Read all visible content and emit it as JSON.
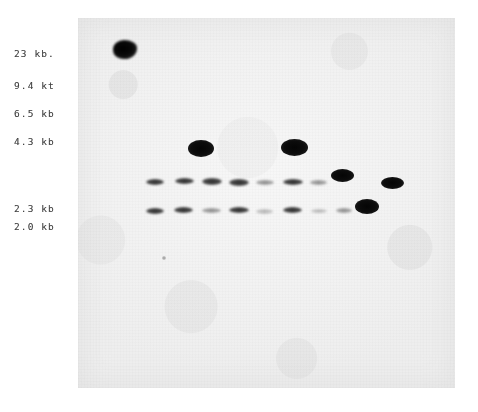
{
  "figure": {
    "type": "southern-blot-autoradiograph",
    "background_color": "#ffffff",
    "membrane_color": "#f2f2f2",
    "band_color": "#141414"
  },
  "marker_ladder": {
    "axis_label": "kb",
    "labels": [
      {
        "text": "23 kb.",
        "value": 23,
        "x": 14,
        "y": 48
      },
      {
        "text": "9.4 kt",
        "value": 9.4,
        "x": 14,
        "y": 80
      },
      {
        "text": "6.5 kb",
        "value": 6.5,
        "x": 14,
        "y": 108
      },
      {
        "text": "4.3 kb",
        "value": 4.3,
        "x": 14,
        "y": 136
      },
      {
        "text": "2.3 kb",
        "value": 2.3,
        "x": 14,
        "y": 203
      },
      {
        "text": "2.0 kb",
        "value": 2.0,
        "x": 14,
        "y": 221
      }
    ]
  },
  "membrane": {
    "x": 78,
    "y": 18,
    "width": 377,
    "height": 370
  },
  "origin_blob": {
    "name": "loading-well-artifact",
    "x": 113,
    "y": 40,
    "width": 24,
    "height": 19
  },
  "dust_speck": {
    "name": "film-dust-speck",
    "x": 162,
    "y": 256,
    "width": 4,
    "height": 4
  },
  "lanes": [
    {
      "index": 1,
      "x": 147
    },
    {
      "index": 2,
      "x": 175
    },
    {
      "index": 3,
      "x": 201
    },
    {
      "index": 4,
      "x": 228
    },
    {
      "index": 5,
      "x": 255
    },
    {
      "index": 6,
      "x": 265
    },
    {
      "index": 7,
      "x": 294
    },
    {
      "index": 8,
      "x": 322
    },
    {
      "index": 9,
      "x": 342
    },
    {
      "index": 10,
      "x": 367
    },
    {
      "index": 11,
      "x": 392
    }
  ],
  "bands": [
    {
      "name": "band-4.3kb-lane3",
      "kb": 4.3,
      "intensity": "strong",
      "x": 188,
      "y": 140,
      "width": 26,
      "height": 17
    },
    {
      "name": "band-4.3kb-lane7",
      "kb": 4.3,
      "intensity": "strong",
      "x": 281,
      "y": 139,
      "width": 27,
      "height": 17
    },
    {
      "name": "band-2.5kb-lane9",
      "kb": 2.5,
      "intensity": "strong",
      "x": 331,
      "y": 169,
      "width": 23,
      "height": 13
    },
    {
      "name": "band-2.5kb-lane11",
      "kb": 2.5,
      "intensity": "strong",
      "x": 381,
      "y": 177,
      "width": 23,
      "height": 12
    },
    {
      "name": "band-2.1kb-lane10",
      "kb": 2.1,
      "intensity": "strong",
      "x": 355,
      "y": 199,
      "width": 24,
      "height": 15
    },
    {
      "name": "band-2.3kb-lane1",
      "kb": 2.3,
      "intensity": "medium",
      "x": 146,
      "y": 179,
      "width": 18,
      "height": 6
    },
    {
      "name": "band-2.3kb-lane2",
      "kb": 2.3,
      "intensity": "medium",
      "x": 175,
      "y": 178,
      "width": 19,
      "height": 6
    },
    {
      "name": "band-2.3kb-lane3",
      "kb": 2.3,
      "intensity": "medium",
      "x": 202,
      "y": 178,
      "width": 20,
      "height": 7
    },
    {
      "name": "band-2.3kb-lane4",
      "kb": 2.3,
      "intensity": "medium",
      "x": 229,
      "y": 179,
      "width": 20,
      "height": 7
    },
    {
      "name": "band-2.3kb-lane5",
      "kb": 2.3,
      "intensity": "faint",
      "x": 256,
      "y": 180,
      "width": 18,
      "height": 5
    },
    {
      "name": "band-2.3kb-lane6",
      "kb": 2.3,
      "intensity": "medium",
      "x": 283,
      "y": 179,
      "width": 20,
      "height": 6
    },
    {
      "name": "band-2.3kb-lane7",
      "kb": 2.3,
      "intensity": "faint",
      "x": 310,
      "y": 180,
      "width": 17,
      "height": 5
    },
    {
      "name": "band-2.0kb-lane1",
      "kb": 2.0,
      "intensity": "medium",
      "x": 146,
      "y": 208,
      "width": 18,
      "height": 6
    },
    {
      "name": "band-2.0kb-lane2",
      "kb": 2.0,
      "intensity": "medium",
      "x": 174,
      "y": 207,
      "width": 19,
      "height": 6
    },
    {
      "name": "band-2.0kb-lane3",
      "kb": 2.0,
      "intensity": "faint",
      "x": 202,
      "y": 208,
      "width": 19,
      "height": 5
    },
    {
      "name": "band-2.0kb-lane4",
      "kb": 2.0,
      "intensity": "medium",
      "x": 229,
      "y": 207,
      "width": 20,
      "height": 6
    },
    {
      "name": "band-2.0kb-lane5",
      "kb": 2.0,
      "intensity": "veryfaint",
      "x": 256,
      "y": 209,
      "width": 17,
      "height": 5
    },
    {
      "name": "band-2.0kb-lane6",
      "kb": 2.0,
      "intensity": "medium",
      "x": 283,
      "y": 207,
      "width": 19,
      "height": 6
    },
    {
      "name": "band-2.0kb-lane7",
      "kb": 2.0,
      "intensity": "veryfaint",
      "x": 311,
      "y": 209,
      "width": 16,
      "height": 4
    },
    {
      "name": "band-2.0kb-lane8",
      "kb": 2.0,
      "intensity": "faint",
      "x": 336,
      "y": 208,
      "width": 16,
      "height": 5
    }
  ]
}
